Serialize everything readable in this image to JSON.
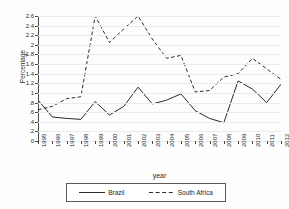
{
  "chart_data": {
    "type": "line",
    "title": "",
    "xlabel": "year",
    "ylabel": "Percentage",
    "xlim": [
      1995,
      2012
    ],
    "ylim": [
      0,
      2.6
    ],
    "grid": true,
    "legend_position": "bottom",
    "x": [
      1995,
      1996,
      1997,
      1998,
      1999,
      2000,
      2001,
      2002,
      2003,
      2004,
      2005,
      2006,
      2007,
      2008,
      2009,
      2010,
      2011,
      2012
    ],
    "xtick_labels": [
      "1995",
      "1996",
      "1997",
      "1998",
      "1999",
      "2000",
      "2001",
      "2002",
      "2003",
      "2004",
      "2005",
      "2006",
      "2007",
      "2008",
      "2009",
      "2010",
      "2011",
      "2012"
    ],
    "ytick_labels": [
      "0",
      ".2",
      ".4",
      ".6",
      ".8",
      "1",
      "1.2",
      "1.4",
      "1.6",
      "1.8",
      "2",
      "2.2",
      "2.4",
      "2.6"
    ],
    "ytick_values": [
      0,
      0.2,
      0.4,
      0.6,
      0.8,
      1,
      1.2,
      1.4,
      1.6,
      1.8,
      2,
      2.2,
      2.4,
      2.6
    ],
    "series": [
      {
        "name": "Brazil",
        "style": "solid",
        "color": "#2b2b2b",
        "values": [
          0.85,
          0.5,
          0.47,
          0.45,
          0.82,
          0.54,
          0.72,
          1.12,
          0.77,
          0.85,
          0.98,
          0.63,
          0.47,
          0.38,
          1.25,
          1.08,
          0.8,
          1.18
        ]
      },
      {
        "name": "South Africa",
        "style": "dashed",
        "color": "#2b2b2b",
        "values": [
          0.65,
          0.72,
          0.88,
          0.92,
          2.6,
          2.05,
          2.33,
          2.6,
          2.12,
          1.72,
          1.78,
          1.02,
          1.05,
          1.33,
          1.4,
          1.72,
          1.5,
          1.28
        ]
      }
    ]
  },
  "legend": {
    "items": [
      {
        "label": "Brazil",
        "style": "solid"
      },
      {
        "label": "South Africa",
        "style": "dashed"
      }
    ]
  }
}
